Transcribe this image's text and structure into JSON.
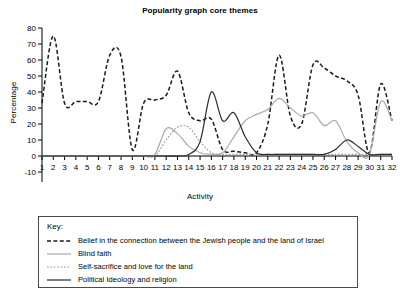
{
  "chart_data": {
    "type": "line",
    "title": "Popularity graph core themes",
    "xlabel": "Activity",
    "ylabel": "Percentage",
    "xlim": [
      1,
      32
    ],
    "ylim": [
      -10,
      80
    ],
    "yticks": [
      -10,
      0,
      10,
      20,
      30,
      40,
      50,
      60,
      70,
      80
    ],
    "grid": false,
    "legend_position": "below-plot",
    "legend_title": "Key:",
    "categories": [
      1,
      2,
      3,
      4,
      5,
      6,
      7,
      8,
      9,
      10,
      11,
      12,
      13,
      14,
      15,
      16,
      17,
      18,
      19,
      20,
      21,
      22,
      23,
      24,
      25,
      26,
      27,
      28,
      29,
      30,
      31,
      32
    ],
    "series": [
      {
        "name": "Belief in the connection between the Jewish people and the land of Israel",
        "style": "dashed",
        "color": "#1a1a1a",
        "values": [
          33,
          75,
          33,
          34,
          34,
          34,
          63,
          62,
          4,
          33,
          35,
          38,
          53,
          27,
          22,
          23,
          4,
          3,
          2,
          2,
          20,
          63,
          25,
          20,
          57,
          55,
          50,
          47,
          38,
          2,
          45,
          22
        ]
      },
      {
        "name": "Blind faith",
        "style": "solid",
        "color": "#aaaaaa",
        "values": [
          0,
          0,
          0,
          0,
          0,
          0,
          0,
          0,
          0,
          0,
          1,
          17,
          14,
          6,
          2,
          1,
          2,
          12,
          22,
          26,
          29,
          36,
          30,
          25,
          27,
          19,
          22,
          9,
          2,
          1,
          34,
          22
        ]
      },
      {
        "name": "Self-sacrifice and love for the land",
        "style": "dotted",
        "color": "#9a9a9a",
        "values": [
          0,
          0,
          0,
          0,
          0,
          0,
          0,
          0,
          0,
          0,
          0,
          10,
          18,
          18,
          9,
          2,
          1,
          1,
          1,
          1,
          1,
          1,
          1,
          1,
          1,
          1,
          1,
          1,
          1,
          1,
          1,
          1
        ]
      },
      {
        "name": "Political Ideology and religion",
        "style": "solid",
        "color": "#2b2b2b",
        "values": [
          0,
          0,
          0,
          0,
          0,
          0,
          0,
          0,
          0,
          0,
          0,
          0,
          0,
          1,
          9,
          40,
          22,
          27,
          12,
          2,
          1,
          1,
          1,
          1,
          1,
          1,
          4,
          10,
          6,
          1,
          1,
          1
        ]
      }
    ]
  }
}
